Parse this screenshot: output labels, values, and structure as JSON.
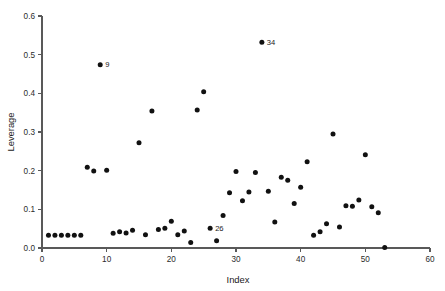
{
  "chart_data": {
    "type": "scatter",
    "title": "",
    "xlabel": "Index",
    "ylabel": "Leverage",
    "xlim": [
      0,
      60
    ],
    "ylim": [
      0.0,
      0.6
    ],
    "grid": false,
    "legend": false,
    "xticks": [
      0,
      10,
      20,
      30,
      40,
      50,
      60
    ],
    "xticklabels": [
      "0",
      "10",
      "20",
      "30",
      "40",
      "50",
      "60"
    ],
    "yticks": [
      0.0,
      0.1,
      0.2,
      0.3,
      0.4,
      0.5,
      0.6
    ],
    "yticklabels": [
      "0.0",
      "0.1",
      "0.2",
      "0.3",
      "0.4",
      "0.5",
      "0.6"
    ],
    "marker": "filled-circle",
    "marker_color": "#111111",
    "x": [
      1,
      2,
      3,
      4,
      5,
      6,
      7,
      8,
      9,
      10,
      11,
      12,
      13,
      14,
      15,
      16,
      17,
      18,
      19,
      20,
      21,
      22,
      23,
      24,
      25,
      26,
      27,
      28,
      29,
      30,
      31,
      32,
      33,
      34,
      35,
      36,
      37,
      38,
      39,
      40,
      41,
      42,
      43,
      44,
      45,
      46,
      47,
      48,
      49,
      50,
      51,
      52,
      53
    ],
    "y": [
      0.033,
      0.033,
      0.033,
      0.033,
      0.033,
      0.033,
      0.209,
      0.199,
      0.474,
      0.201,
      0.038,
      0.042,
      0.039,
      0.046,
      0.272,
      0.034,
      0.354,
      0.048,
      0.051,
      0.069,
      0.034,
      0.044,
      0.014,
      0.357,
      0.404,
      0.051,
      0.019,
      0.084,
      0.143,
      0.198,
      0.122,
      0.145,
      0.195,
      0.532,
      0.147,
      0.067,
      0.183,
      0.175,
      0.115,
      0.157,
      0.223,
      0.033,
      0.042,
      0.063,
      0.295,
      0.054,
      0.109,
      0.108,
      0.124,
      0.241,
      0.107,
      0.091,
      0.001
    ],
    "annotations": [
      {
        "label": "9",
        "x": 9,
        "y": 0.474
      },
      {
        "label": "34",
        "x": 34,
        "y": 0.532
      },
      {
        "label": "26",
        "x": 26,
        "y": 0.051
      }
    ]
  }
}
